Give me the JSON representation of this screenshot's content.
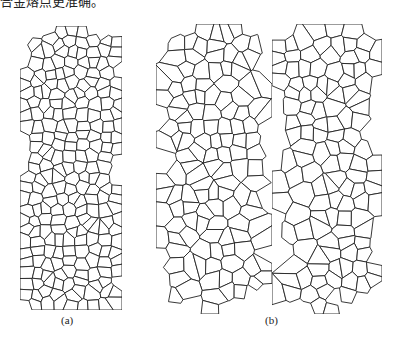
{
  "caption_fragment": "合金熔点更准确。",
  "figure": {
    "panels": [
      {
        "id": "a-structure",
        "x": 20,
        "y": 26,
        "w": 102,
        "h": 284,
        "seed": 7,
        "cells": 240,
        "coarse": false
      },
      {
        "id": "b-structure-left",
        "x": 156,
        "y": 24,
        "w": 116,
        "h": 290,
        "seed": 19,
        "cells": 190,
        "coarse": true
      },
      {
        "id": "b-structure-right",
        "x": 272,
        "y": 24,
        "w": 110,
        "h": 290,
        "seed": 33,
        "cells": 175,
        "coarse": true
      }
    ],
    "labels": {
      "a": "(a)",
      "b": "(b)"
    },
    "line_color": "#222222"
  }
}
